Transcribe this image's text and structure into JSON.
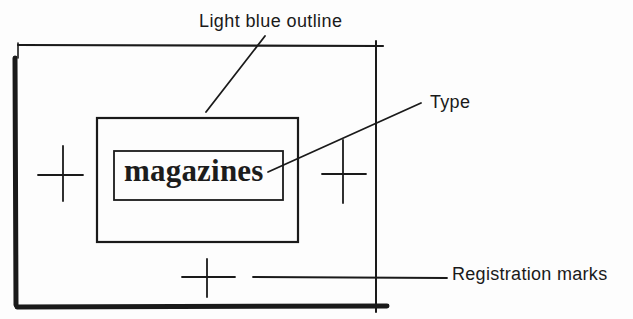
{
  "diagram": {
    "labels": {
      "outline": "Light blue outline",
      "type": "Type",
      "registration": "Registration marks"
    },
    "type_sample": "magazines",
    "colors": {
      "ink": "#1a1a1a",
      "paper": "#fdfdfd"
    },
    "elements": {
      "outer_frame": {
        "left": 15,
        "top": 45,
        "right": 376,
        "bottom": 307
      },
      "light_blue_outline_box": {
        "left": 97,
        "top": 118,
        "right": 298,
        "bottom": 242
      },
      "type_box": {
        "left": 114,
        "top": 151,
        "right": 283,
        "bottom": 200
      },
      "registration_marks": [
        {
          "position": "left",
          "cx": 63,
          "cy": 175
        },
        {
          "position": "right",
          "cx": 343,
          "cy": 174
        },
        {
          "position": "bottom",
          "cx": 207,
          "cy": 277
        }
      ]
    }
  }
}
